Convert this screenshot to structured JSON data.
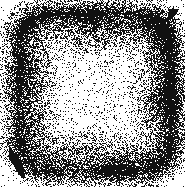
{
  "image": {
    "kind": "dithered-halftone-scan",
    "width": 185,
    "height": 187,
    "background_color": "#ffffff",
    "ink_color": "#111111",
    "alt_text": "Black and white dithered scan of a rounded square with dark edges fading to a light center",
    "caption": ""
  },
  "blob": {
    "name": "rounded-square-vignette",
    "shape": "rounded-square",
    "bounds": {
      "x": 18,
      "y": 14,
      "width": 154,
      "height": 158
    },
    "corner_radius": 34,
    "edge_softness": 22,
    "center": {
      "x": 96,
      "y": 96
    },
    "core_light_radius": 46,
    "max_density": 0.93,
    "min_density": 0.07,
    "darkest_region": {
      "x": 95,
      "y": 20,
      "width": 50,
      "height": 32
    },
    "density_profile": {
      "top_edge": 0.9,
      "right_edge": 0.82,
      "bottom_edge": 0.72,
      "left_edge": 0.66,
      "center": 0.08
    },
    "dither": {
      "type": "random-threshold",
      "cell_size": 1,
      "seed": 20240517,
      "grain": 0.38
    }
  },
  "artifacts": [
    {
      "name": "speck-top-left",
      "type": "speck",
      "x": 11,
      "y": 13,
      "width": 3,
      "height": 3,
      "density": 0.85
    },
    {
      "name": "hook-mark-top-right",
      "type": "hook",
      "x": 162,
      "y": 9,
      "width": 11,
      "height": 13,
      "density": 0.95
    },
    {
      "name": "streak-bottom-left",
      "type": "diagonal-streak",
      "x1": 10,
      "y1": 149,
      "x2": 23,
      "y2": 177,
      "thickness": 3,
      "density": 0.9
    }
  ]
}
